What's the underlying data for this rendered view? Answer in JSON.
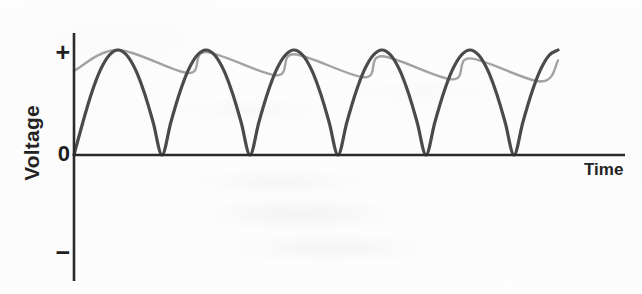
{
  "figure": {
    "kind": "waveform-plot",
    "background_color": "#fefefe"
  },
  "axes": {
    "y_label": "Voltage",
    "x_label": "Time",
    "y_ticks": [
      {
        "name": "positive",
        "label": "+",
        "pixel_y": 52
      },
      {
        "name": "zero",
        "label": "0",
        "pixel_y": 155
      },
      {
        "name": "negative",
        "label": "−",
        "pixel_y": 255
      }
    ],
    "axis_color": "#2b2b2b",
    "y_axis_x": 74,
    "y_axis_top": 33,
    "y_axis_bottom": 281,
    "x_axis_y": 155,
    "x_axis_left": 74,
    "x_axis_right": 625
  },
  "series": {
    "rectified": {
      "name": "full-wave-rectified-sine",
      "color": "#4a4a4a",
      "stroke_width": 3.2,
      "description": "Full-wave rectified sine wave, all half-cycles positive, touching zero between humps"
    },
    "filtered": {
      "name": "filtered-ripple-envelope",
      "color": "#9d9d9d",
      "stroke_width": 2.4,
      "description": "Capacitor-filtered output riding the peaks and decaying between them"
    }
  },
  "chart_data": {
    "type": "line",
    "title": "",
    "subtitle": "",
    "xlabel": "Time",
    "ylabel": "Voltage",
    "grid": false,
    "legend": "none",
    "xlim": [
      0,
      5.6
    ],
    "ylim": [
      -1,
      1
    ],
    "ytick_labels": [
      "+",
      "0",
      "−"
    ],
    "ytick_values": [
      1,
      0,
      -1
    ],
    "xtick_labels": [],
    "annotations": [],
    "series": [
      {
        "name": "full-wave-rectified-sine",
        "color": "#4a4a4a",
        "x": [
          0.0,
          0.1,
          0.2,
          0.3,
          0.4,
          0.5,
          0.6,
          0.7,
          0.8,
          0.9,
          1.0,
          1.1,
          1.2,
          1.3,
          1.4,
          1.5,
          1.6,
          1.7,
          1.8,
          1.9,
          2.0,
          2.1,
          2.2,
          2.3,
          2.4,
          2.5,
          2.6,
          2.7,
          2.8,
          2.9,
          3.0,
          3.1,
          3.2,
          3.3,
          3.4,
          3.5,
          3.6,
          3.7,
          3.8,
          3.9,
          4.0,
          4.1,
          4.2,
          4.3,
          4.4,
          4.5,
          4.6,
          4.7,
          4.8,
          4.9,
          5.0,
          5.1,
          5.2,
          5.3,
          5.4,
          5.5
        ],
        "y": [
          0.0,
          0.31,
          0.59,
          0.81,
          0.95,
          1.0,
          0.95,
          0.81,
          0.59,
          0.31,
          0.0,
          0.31,
          0.59,
          0.81,
          0.95,
          1.0,
          0.95,
          0.81,
          0.59,
          0.31,
          0.0,
          0.31,
          0.59,
          0.81,
          0.95,
          1.0,
          0.95,
          0.81,
          0.59,
          0.31,
          0.0,
          0.31,
          0.59,
          0.81,
          0.95,
          1.0,
          0.95,
          0.81,
          0.59,
          0.31,
          0.0,
          0.31,
          0.59,
          0.81,
          0.95,
          1.0,
          0.95,
          0.81,
          0.59,
          0.31,
          0.0,
          0.31,
          0.59,
          0.81,
          0.95,
          1.0
        ]
      },
      {
        "name": "filtered-ripple-envelope",
        "color": "#9d9d9d",
        "x": [
          0.0,
          0.5,
          1.5,
          2.5,
          3.5,
          4.5,
          5.5
        ],
        "y": [
          0.8,
          1.0,
          0.98,
          0.96,
          0.94,
          0.92,
          0.9
        ],
        "ripple_minima_y": [
          0.78,
          0.76,
          0.74,
          0.72,
          0.7
        ]
      }
    ]
  },
  "geometry": {
    "peak_x_pixels": [
      118,
      218,
      318,
      418,
      518
    ],
    "zero_x_pixels": [
      74,
      168,
      268,
      368,
      468,
      568
    ],
    "peak_y_pixel": 50,
    "period_pixels": 100
  }
}
